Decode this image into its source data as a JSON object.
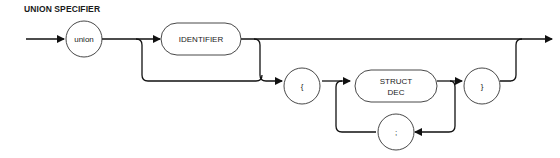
{
  "title": "UNION SPECIFIER",
  "nodes": {
    "union": "union",
    "identifier": "IDENTIFIER",
    "lbrace": "{",
    "struct_dec_line1": "STRUCT",
    "struct_dec_line2": "DEC",
    "rbrace": "}",
    "semicolon": ";"
  }
}
